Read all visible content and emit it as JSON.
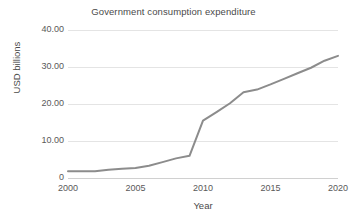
{
  "chart_data": {
    "type": "line",
    "title": "Government consumption expenditure",
    "xlabel": "Year",
    "ylabel": "USD billions",
    "xlim": [
      2000,
      2020
    ],
    "ylim": [
      0,
      40
    ],
    "grid": true,
    "legend": "none",
    "y_ticks": [
      "40.00",
      "30.00",
      "20.00",
      "10.00",
      "0"
    ],
    "y_tick_values": [
      40,
      30,
      20,
      10,
      0
    ],
    "x_ticks": [
      "2000",
      "2005",
      "2010",
      "2015",
      "2020"
    ],
    "x_tick_values": [
      2000,
      2005,
      2010,
      2015,
      2020
    ],
    "series": [
      {
        "name": "Government consumption expenditure",
        "color": "#8c8c8c",
        "x": [
          2000,
          2001,
          2002,
          2003,
          2004,
          2005,
          2006,
          2007,
          2008,
          2009,
          2010,
          2011,
          2012,
          2013,
          2014,
          2015,
          2016,
          2017,
          2018,
          2019,
          2020
        ],
        "values": [
          1.8,
          1.8,
          1.8,
          2.2,
          2.5,
          2.7,
          3.3,
          4.3,
          5.3,
          6.0,
          15.5,
          17.8,
          20.2,
          23.2,
          23.9,
          25.3,
          26.8,
          28.3,
          29.8,
          31.7,
          33.0
        ]
      }
    ]
  }
}
